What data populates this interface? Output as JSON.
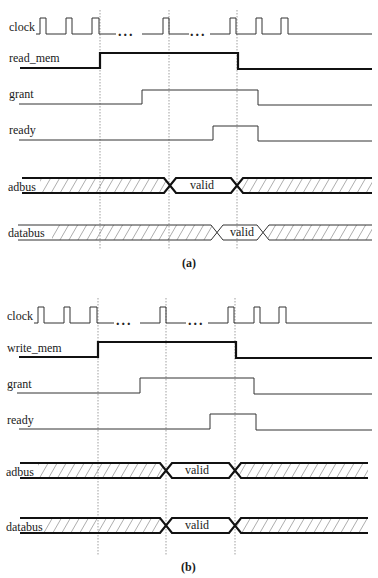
{
  "diagrams": [
    {
      "caption": "(a)",
      "signals": {
        "clock": "clock",
        "control": "read_mem",
        "grant": "grant",
        "ready": "ready",
        "adbus": "adbus",
        "databus": "databus"
      },
      "adbus_value": "valid",
      "databus_value": "valid",
      "ellipsis": "..."
    },
    {
      "caption": "(b)",
      "signals": {
        "clock": "clock",
        "control": "write_mem",
        "grant": "grant",
        "ready": "ready",
        "adbus": "adbus",
        "databus": "databus"
      },
      "adbus_value": "valid",
      "databus_value": "valid",
      "ellipsis": "..."
    }
  ],
  "colors": {
    "line": "#333333",
    "background": "#ffffff"
  }
}
